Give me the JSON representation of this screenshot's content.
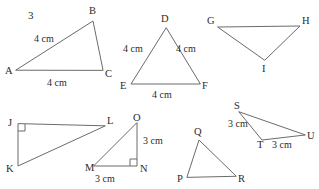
{
  "worksheet": {
    "problem_number": "3",
    "units": "cm"
  },
  "colors": {
    "stroke": "#6b6b6b",
    "text": "#2b2b2b",
    "background": "#ffffff"
  },
  "figures": [
    {
      "id": "triangle-abc",
      "vertices": [
        {
          "label": "A",
          "x": 16,
          "y": 70,
          "label_x": 5,
          "label_y": 74
        },
        {
          "label": "B",
          "x": 93,
          "y": 21,
          "label_x": 89,
          "label_y": 14
        },
        {
          "label": "C",
          "x": 103,
          "y": 70,
          "label_x": 105,
          "label_y": 77
        }
      ],
      "side_labels": [
        {
          "text": "4 cm",
          "x": 34,
          "y": 42
        },
        {
          "text": "4 cm",
          "x": 47,
          "y": 86
        }
      ],
      "right_angle": null
    },
    {
      "id": "triangle-def",
      "vertices": [
        {
          "label": "D",
          "x": 166,
          "y": 28,
          "label_x": 161,
          "label_y": 22
        },
        {
          "label": "E",
          "x": 131,
          "y": 84,
          "label_x": 120,
          "label_y": 89
        },
        {
          "label": "F",
          "x": 200,
          "y": 84,
          "label_x": 202,
          "label_y": 89
        }
      ],
      "side_labels": [
        {
          "text": "4 cm",
          "x": 123,
          "y": 52
        },
        {
          "text": "4 cm",
          "x": 176,
          "y": 52
        },
        {
          "text": "4 cm",
          "x": 152,
          "y": 98
        }
      ],
      "right_angle": null
    },
    {
      "id": "triangle-ghi",
      "vertices": [
        {
          "label": "G",
          "x": 218,
          "y": 27,
          "label_x": 207,
          "label_y": 24
        },
        {
          "label": "H",
          "x": 300,
          "y": 26,
          "label_x": 302,
          "label_y": 24
        },
        {
          "label": "I",
          "x": 265,
          "y": 60,
          "label_x": 262,
          "label_y": 72
        }
      ],
      "side_labels": [],
      "right_angle": null
    },
    {
      "id": "triangle-jkl",
      "vertices": [
        {
          "label": "J",
          "x": 18,
          "y": 124,
          "label_x": 8,
          "label_y": 126
        },
        {
          "label": "K",
          "x": 18,
          "y": 166,
          "label_x": 6,
          "label_y": 172
        },
        {
          "label": "L",
          "x": 105,
          "y": 126,
          "label_x": 107,
          "label_y": 124
        }
      ],
      "side_labels": [],
      "right_angle": {
        "vertex": "J",
        "x": 18,
        "y": 124,
        "dx": 1,
        "dy": 1,
        "size": 7
      }
    },
    {
      "id": "triangle-mno",
      "vertices": [
        {
          "label": "M",
          "x": 94,
          "y": 166,
          "label_x": 85,
          "label_y": 171
        },
        {
          "label": "N",
          "x": 137,
          "y": 166,
          "label_x": 140,
          "label_y": 172
        },
        {
          "label": "O",
          "x": 137,
          "y": 123,
          "label_x": 133,
          "label_y": 121
        }
      ],
      "side_labels": [
        {
          "text": "3 cm",
          "x": 143,
          "y": 144
        },
        {
          "text": "3 cm",
          "x": 95,
          "y": 182
        }
      ],
      "right_angle": {
        "vertex": "N",
        "x": 137,
        "y": 166,
        "dx": -1,
        "dy": -1,
        "size": 7
      }
    },
    {
      "id": "triangle-pqr",
      "vertices": [
        {
          "label": "P",
          "x": 187,
          "y": 177,
          "label_x": 177,
          "label_y": 182
        },
        {
          "label": "Q",
          "x": 199,
          "y": 140,
          "label_x": 194,
          "label_y": 135
        },
        {
          "label": "R",
          "x": 236,
          "y": 176,
          "label_x": 238,
          "label_y": 182
        }
      ],
      "side_labels": [],
      "right_angle": null
    },
    {
      "id": "triangle-stu",
      "vertices": [
        {
          "label": "S",
          "x": 239,
          "y": 112,
          "label_x": 234,
          "label_y": 109
        },
        {
          "label": "T",
          "x": 262,
          "y": 140,
          "label_x": 257,
          "label_y": 148
        },
        {
          "label": "U",
          "x": 305,
          "y": 135,
          "label_x": 307,
          "label_y": 139
        }
      ],
      "side_labels": [
        {
          "text": "3 cm",
          "x": 228,
          "y": 127
        },
        {
          "text": "3 cm",
          "x": 272,
          "y": 148
        }
      ],
      "right_angle": null
    }
  ]
}
